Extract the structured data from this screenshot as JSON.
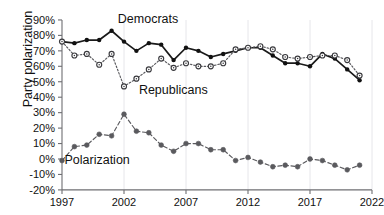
{
  "chart_data": {
    "type": "line",
    "title": "",
    "xlabel": "",
    "ylabel": "Party polarization",
    "xlim": [
      1997,
      2022
    ],
    "ylim": [
      -20,
      90
    ],
    "ytick_labels": [
      "90%",
      "80%",
      "70%",
      "60%",
      "50%",
      "40%",
      "30%",
      "20%",
      "10%",
      "0%",
      "-10%",
      "-20%"
    ],
    "ytick_values": [
      90,
      80,
      70,
      60,
      50,
      40,
      30,
      20,
      10,
      0,
      -10,
      -20
    ],
    "xtick_labels": [
      "1997",
      "2002",
      "2007",
      "2012",
      "2017",
      "2022"
    ],
    "xtick_values": [
      1997,
      2002,
      2007,
      2012,
      2017,
      2022
    ],
    "grid": "vertical-only",
    "legend_position": "inline-annotations",
    "x": [
      1997,
      1998,
      1999,
      2000,
      2001,
      2002,
      2003,
      2004,
      2005,
      2006,
      2007,
      2008,
      2009,
      2010,
      2011,
      2012,
      2013,
      2014,
      2015,
      2016,
      2017,
      2018,
      2019,
      2020,
      2021
    ],
    "series": [
      {
        "name": "Democrats",
        "marker": "filled-circle",
        "color": "#1a1a1a",
        "linestyle": "solid",
        "values": [
          76,
          75,
          77,
          77,
          83,
          76,
          70,
          75,
          74,
          64,
          72,
          70,
          66,
          68,
          70,
          72,
          72,
          67,
          62,
          62,
          60,
          68,
          65,
          58,
          51
        ]
      },
      {
        "name": "Republicans",
        "marker": "open-circle",
        "color": "#58585c",
        "linestyle": "dotted",
        "values": [
          76,
          67,
          68,
          61,
          68,
          47,
          52,
          58,
          65,
          59,
          62,
          60,
          60,
          62,
          71,
          72,
          73,
          71,
          66,
          65,
          66,
          67,
          67,
          64,
          54
        ]
      },
      {
        "name": "Polarization",
        "marker": "filled-circle-gray",
        "color": "#5a5a5e",
        "linestyle": "dashed",
        "values": [
          -1,
          8,
          9,
          16,
          15,
          29,
          18,
          17,
          9,
          5,
          10,
          10,
          6,
          6,
          -1,
          1,
          -2,
          -5,
          -4,
          -5,
          0,
          -1,
          -4,
          -7,
          -4
        ]
      }
    ],
    "annotations": [
      {
        "text": "Democrats",
        "x": 2001.5,
        "y": 88
      },
      {
        "text": "Republicans",
        "x": 2003.2,
        "y": 42
      },
      {
        "text": "Polarization",
        "x": 1997.2,
        "y": -3
      }
    ]
  }
}
